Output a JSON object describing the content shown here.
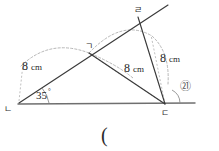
{
  "figure": {
    "type": "geometry-diagram",
    "vertices": [
      {
        "id": "n",
        "label": "ㄴ",
        "x": 18,
        "y": 104,
        "label_x": 4,
        "label_y": 112
      },
      {
        "id": "g",
        "label": "ㄱ",
        "x": 89,
        "y": 53,
        "label_x": 85,
        "label_y": 49
      },
      {
        "id": "d",
        "label": "ㄷ",
        "x": 165,
        "y": 104,
        "label_x": 161,
        "label_y": 116
      },
      {
        "id": "r",
        "label": "ㄹ",
        "x": 138,
        "y": 17,
        "label_x": 134,
        "label_y": 13
      }
    ],
    "measurements": [
      {
        "id": "len-n-g",
        "value": "8",
        "unit": "cm",
        "x": 22,
        "y": 70
      },
      {
        "id": "len-d-g",
        "value": "8",
        "unit": "cm",
        "x": 124,
        "y": 72
      },
      {
        "id": "len-d-r",
        "value": "8",
        "unit": "cm",
        "x": 160,
        "y": 62
      }
    ],
    "angles": [
      {
        "id": "angle-n",
        "value": "35",
        "unit": "°",
        "x": 36,
        "y": 99
      },
      {
        "id": "angle-circled",
        "value": "㉑",
        "x": 180,
        "y": 90
      }
    ],
    "caption": "(",
    "caption_x": 101,
    "caption_y": 142,
    "colors": {
      "solid_stroke": "#3a3a3a",
      "base_stroke": "#6f6f6f",
      "dashed_stroke": "#a9a9a9",
      "text": "#1f1f1f",
      "background": "#ffffff"
    }
  }
}
